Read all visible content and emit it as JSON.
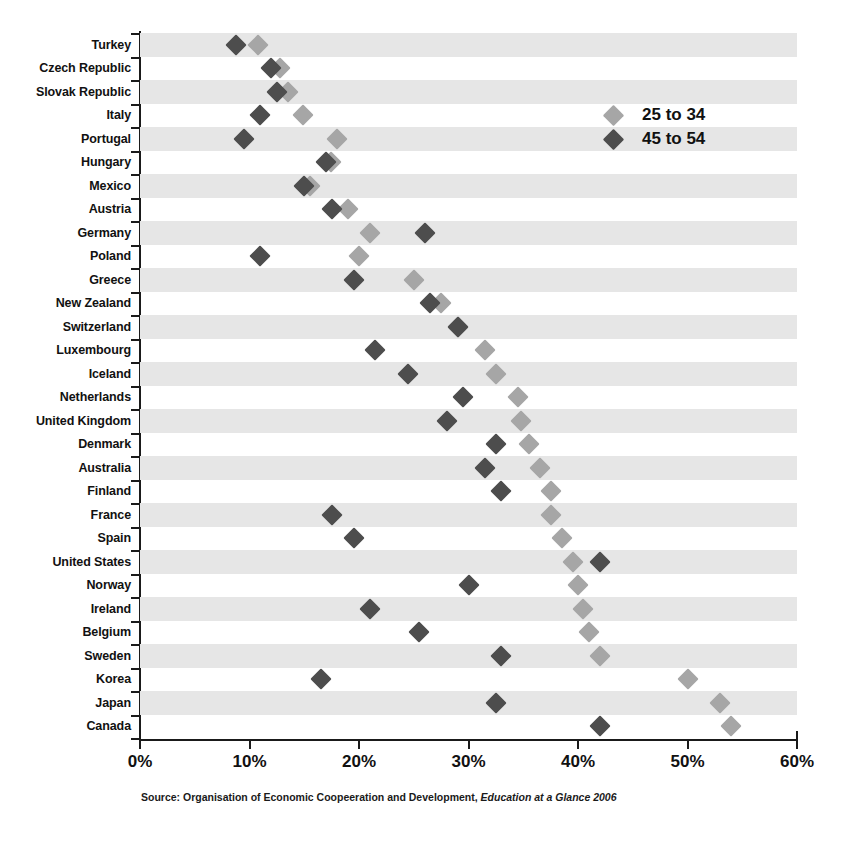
{
  "chart_data": {
    "type": "scatter",
    "title": "",
    "subtitle": "",
    "xlabel": "",
    "ylabel": "",
    "xlim": [
      0,
      60
    ],
    "xticks": [
      0,
      10,
      20,
      30,
      40,
      50,
      60
    ],
    "xtick_labels": [
      "0%",
      "10%",
      "20%",
      "30%",
      "40%",
      "50%",
      "60%"
    ],
    "grid": false,
    "legend_position": "upper-right",
    "legend": [
      "25 to 34",
      "45 to 54"
    ],
    "series": [
      {
        "name": "25 to 34",
        "color": "#a6a6a6",
        "values": [
          10.8,
          12.8,
          13.5,
          14.9,
          18.0,
          17.4,
          15.5,
          19.0,
          21.0,
          20.0,
          25.0,
          27.5,
          29.0,
          31.5,
          32.5,
          34.5,
          34.8,
          35.5,
          36.5,
          37.5,
          37.5,
          38.5,
          39.5,
          40.0,
          40.5,
          41.0,
          42.0,
          50.0,
          53.0,
          54.0
        ]
      },
      {
        "name": "45 to 54",
        "color": "#4d4d4d",
        "values": [
          8.8,
          12.0,
          12.5,
          11.0,
          9.5,
          17.0,
          15.0,
          17.5,
          26.0,
          11.0,
          19.5,
          26.5,
          29.0,
          21.5,
          24.5,
          29.5,
          28.0,
          32.5,
          31.5,
          33.0,
          17.5,
          19.5,
          42.0,
          30.0,
          21.0,
          25.5,
          33.0,
          16.5,
          32.5,
          42.0
        ]
      }
    ],
    "categories": [
      "Turkey",
      "Czech Republic",
      "Slovak Republic",
      "Italy",
      "Portugal",
      "Hungary",
      "Mexico",
      "Austria",
      "Germany",
      "Poland",
      "Greece",
      "New Zealand",
      "Switzerland",
      "Luxembourg",
      "Iceland",
      "Netherlands",
      "United Kingdom",
      "Denmark",
      "Australia",
      "Finland",
      "France",
      "Spain",
      "United States",
      "Norway",
      "Ireland",
      "Belgium",
      "Sweden",
      "Korea",
      "Japan",
      "Canada"
    ]
  },
  "legend": {
    "items": [
      {
        "label": "25 to 34",
        "marker": "diamond-light-icon",
        "color": "#a6a6a6"
      },
      {
        "label": "45 to 54",
        "marker": "diamond-dark-icon",
        "color": "#4d4d4d"
      }
    ]
  },
  "source": {
    "prefix": "Source: Organisation of Economic Coopeeration and Development, ",
    "italic": "Education at a Glance 2006"
  },
  "style": {
    "band_color": "#e6e6e6",
    "axis_color": "#1a1a1a",
    "background": "#ffffff"
  }
}
